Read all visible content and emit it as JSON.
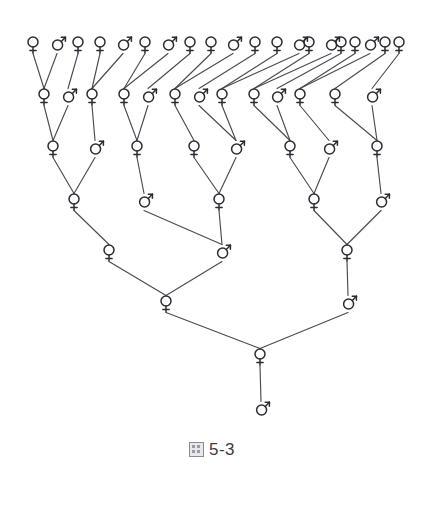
{
  "figure": {
    "caption_glyph": "圖",
    "caption_number": "5-3",
    "symbol_female": "female-symbol",
    "symbol_male": "male-symbol",
    "line_color": "#4a4a52",
    "symbol_color": "#2b2b33",
    "background_color": "#ffffff"
  },
  "chart_data": {
    "type": "diagram",
    "diagram_kind": "pedigree-tree",
    "generations": 8,
    "rows": [
      {
        "row": 1,
        "y": 44,
        "count": 20,
        "nodes": [
          {
            "id": "g1n1",
            "sex": "female",
            "x": 33
          },
          {
            "id": "g1n2",
            "sex": "male",
            "x": 57
          },
          {
            "id": "g1n3",
            "sex": "female",
            "x": 78
          },
          {
            "id": "g1n4",
            "sex": "female",
            "x": 100
          },
          {
            "id": "g1n5",
            "sex": "male",
            "x": 123
          },
          {
            "id": "g1n6",
            "sex": "female",
            "x": 145
          },
          {
            "id": "g1n7",
            "sex": "male",
            "x": 168
          },
          {
            "id": "g1n8",
            "sex": "female",
            "x": 190
          },
          {
            "id": "g1n9",
            "sex": "female",
            "x": 211
          },
          {
            "id": "g1n10",
            "sex": "male",
            "x": 233
          },
          {
            "id": "g1n11",
            "sex": "female",
            "x": 255
          },
          {
            "id": "g1n12",
            "sex": "female",
            "x": 277
          },
          {
            "id": "g1n13",
            "sex": "male",
            "x": 299
          },
          {
            "id": "g1n14",
            "sex": "female",
            "x": 309
          },
          {
            "id": "g1n15",
            "sex": "male",
            "x": 331
          },
          {
            "id": "g1n16",
            "sex": "female",
            "x": 341
          },
          {
            "id": "g1n17",
            "sex": "female",
            "x": 355
          },
          {
            "id": "g1n18",
            "sex": "male",
            "x": 370
          },
          {
            "id": "g1n19",
            "sex": "female",
            "x": 385
          },
          {
            "id": "g1n20",
            "sex": "female",
            "x": 399
          }
        ]
      },
      {
        "row": 2,
        "y": 96,
        "count": 13,
        "nodes": [
          {
            "id": "g2n1",
            "sex": "female",
            "x": 44
          },
          {
            "id": "g2n2",
            "sex": "male",
            "x": 68
          },
          {
            "id": "g2n3",
            "sex": "female",
            "x": 92
          },
          {
            "id": "g2n4",
            "sex": "female",
            "x": 124
          },
          {
            "id": "g2n5",
            "sex": "male",
            "x": 148
          },
          {
            "id": "g2n6",
            "sex": "female",
            "x": 175
          },
          {
            "id": "g2n7",
            "sex": "male",
            "x": 199
          },
          {
            "id": "g2n8",
            "sex": "female",
            "x": 222
          },
          {
            "id": "g2n9",
            "sex": "female",
            "x": 254
          },
          {
            "id": "g2n10",
            "sex": "male",
            "x": 277
          },
          {
            "id": "g2n11",
            "sex": "female",
            "x": 300
          },
          {
            "id": "g2n12",
            "sex": "female",
            "x": 335
          },
          {
            "id": "g2n13",
            "sex": "male",
            "x": 372
          }
        ]
      },
      {
        "row": 3,
        "y": 148,
        "count": 8,
        "nodes": [
          {
            "id": "g3n1",
            "sex": "female",
            "x": 53
          },
          {
            "id": "g3n2",
            "sex": "male",
            "x": 95
          },
          {
            "id": "g3n3",
            "sex": "female",
            "x": 137
          },
          {
            "id": "g3n4",
            "sex": "female",
            "x": 194
          },
          {
            "id": "g3n5",
            "sex": "male",
            "x": 236
          },
          {
            "id": "g3n6",
            "sex": "female",
            "x": 290
          },
          {
            "id": "g3n7",
            "sex": "male",
            "x": 329
          },
          {
            "id": "g3n8",
            "sex": "female",
            "x": 377
          }
        ]
      },
      {
        "row": 4,
        "y": 201,
        "count": 5,
        "nodes": [
          {
            "id": "g4n1",
            "sex": "female",
            "x": 74
          },
          {
            "id": "g4n2",
            "sex": "male",
            "x": 144
          },
          {
            "id": "g4n3",
            "sex": "female",
            "x": 219
          },
          {
            "id": "g4n4",
            "sex": "female",
            "x": 314
          },
          {
            "id": "g4n5",
            "sex": "male",
            "x": 381
          }
        ]
      },
      {
        "row": 5,
        "y": 252,
        "count": 3,
        "nodes": [
          {
            "id": "g5n1",
            "sex": "female",
            "x": 109
          },
          {
            "id": "g5n2",
            "sex": "male",
            "x": 222
          },
          {
            "id": "g5n3",
            "sex": "female",
            "x": 347
          }
        ]
      },
      {
        "row": 6,
        "y": 303,
        "count": 2,
        "nodes": [
          {
            "id": "g6n1",
            "sex": "female",
            "x": 166
          },
          {
            "id": "g6n2",
            "sex": "male",
            "x": 348
          }
        ]
      },
      {
        "row": 7,
        "y": 356,
        "count": 1,
        "nodes": [
          {
            "id": "g7n1",
            "sex": "female",
            "x": 260
          }
        ]
      },
      {
        "row": 8,
        "y": 409,
        "count": 1,
        "nodes": [
          {
            "id": "g8n1",
            "sex": "male",
            "x": 261
          }
        ]
      }
    ],
    "edges": [
      {
        "from": "g1n1",
        "to": "g2n1"
      },
      {
        "from": "g1n2",
        "to": "g2n1"
      },
      {
        "from": "g1n3",
        "to": "g2n2"
      },
      {
        "from": "g1n4",
        "to": "g2n3"
      },
      {
        "from": "g1n5",
        "to": "g2n3"
      },
      {
        "from": "g1n6",
        "to": "g2n4"
      },
      {
        "from": "g1n7",
        "to": "g2n4"
      },
      {
        "from": "g1n8",
        "to": "g2n5"
      },
      {
        "from": "g1n9",
        "to": "g2n6"
      },
      {
        "from": "g1n10",
        "to": "g2n6"
      },
      {
        "from": "g1n11",
        "to": "g2n7"
      },
      {
        "from": "g1n12",
        "to": "g2n8"
      },
      {
        "from": "g1n13",
        "to": "g2n8"
      },
      {
        "from": "g1n14",
        "to": "g2n9"
      },
      {
        "from": "g1n15",
        "to": "g2n9"
      },
      {
        "from": "g1n16",
        "to": "g2n10"
      },
      {
        "from": "g1n17",
        "to": "g2n11"
      },
      {
        "from": "g1n18",
        "to": "g2n11"
      },
      {
        "from": "g1n19",
        "to": "g2n12"
      },
      {
        "from": "g1n20",
        "to": "g2n13"
      },
      {
        "from": "g2n1",
        "to": "g3n1"
      },
      {
        "from": "g2n2",
        "to": "g3n1"
      },
      {
        "from": "g2n3",
        "to": "g3n2"
      },
      {
        "from": "g2n4",
        "to": "g3n3"
      },
      {
        "from": "g2n5",
        "to": "g3n3"
      },
      {
        "from": "g2n6",
        "to": "g3n4"
      },
      {
        "from": "g2n7",
        "to": "g3n5"
      },
      {
        "from": "g2n8",
        "to": "g3n5"
      },
      {
        "from": "g2n9",
        "to": "g3n6"
      },
      {
        "from": "g2n10",
        "to": "g3n6"
      },
      {
        "from": "g2n11",
        "to": "g3n7"
      },
      {
        "from": "g2n12",
        "to": "g3n8"
      },
      {
        "from": "g2n13",
        "to": "g3n8"
      },
      {
        "from": "g3n1",
        "to": "g4n1"
      },
      {
        "from": "g3n2",
        "to": "g4n1"
      },
      {
        "from": "g3n3",
        "to": "g4n2"
      },
      {
        "from": "g3n4",
        "to": "g4n3"
      },
      {
        "from": "g3n5",
        "to": "g4n3"
      },
      {
        "from": "g3n6",
        "to": "g4n4"
      },
      {
        "from": "g3n7",
        "to": "g4n4"
      },
      {
        "from": "g3n8",
        "to": "g4n5"
      },
      {
        "from": "g4n1",
        "to": "g5n1"
      },
      {
        "from": "g4n2",
        "to": "g5n2"
      },
      {
        "from": "g4n3",
        "to": "g5n2"
      },
      {
        "from": "g4n4",
        "to": "g5n3"
      },
      {
        "from": "g4n5",
        "to": "g5n3"
      },
      {
        "from": "g5n1",
        "to": "g6n1"
      },
      {
        "from": "g5n2",
        "to": "g6n1"
      },
      {
        "from": "g5n3",
        "to": "g6n2"
      },
      {
        "from": "g6n1",
        "to": "g7n1"
      },
      {
        "from": "g6n2",
        "to": "g7n1"
      },
      {
        "from": "g7n1",
        "to": "g8n1"
      }
    ]
  }
}
